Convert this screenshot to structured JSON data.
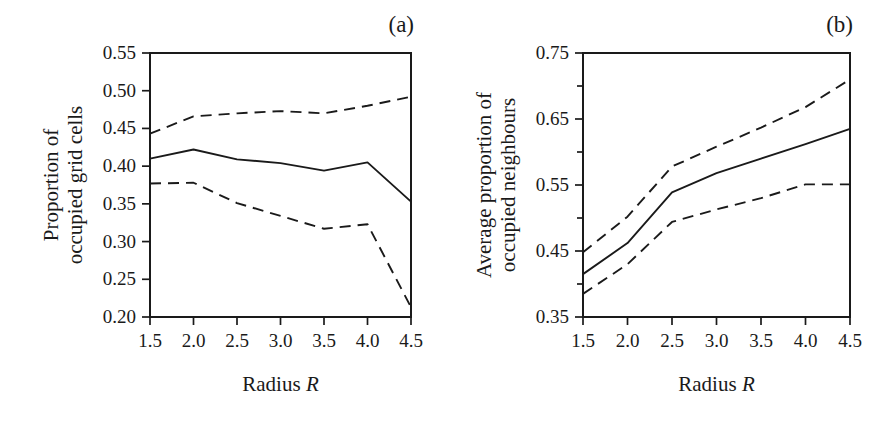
{
  "figure": {
    "panel_a_tag": "(a)",
    "panel_b_tag": "(b)",
    "xlabel_text": "Radius",
    "xlabel_symbol": "R"
  },
  "chart_data": [
    {
      "type": "line",
      "panel": "(a)",
      "title": "",
      "xlabel": "Radius R",
      "ylabel": "Proportion of occupied grid cells",
      "ylabel_line1": "Proportion of",
      "ylabel_line2": "occupied grid cells",
      "x": [
        1.5,
        2.0,
        2.5,
        3.0,
        3.5,
        4.0,
        4.5
      ],
      "xlim": [
        1.5,
        4.5
      ],
      "ylim": [
        0.2,
        0.55
      ],
      "xticks": [
        1.5,
        2.0,
        2.5,
        3.0,
        3.5,
        4.0,
        4.5
      ],
      "xticklabels": [
        "1.5",
        "2.0",
        "2.5",
        "3.0",
        "3.5",
        "4.0",
        "4.5"
      ],
      "yticks": [
        0.2,
        0.25,
        0.3,
        0.35,
        0.4,
        0.45,
        0.5,
        0.55
      ],
      "yticklabels": [
        "0.20",
        "0.25",
        "0.30",
        "0.35",
        "0.40",
        "0.45",
        "0.50",
        "0.55"
      ],
      "grid": false,
      "legend": "none",
      "series": [
        {
          "name": "upper confidence bound",
          "style": "dashed",
          "values": [
            0.443,
            0.466,
            0.47,
            0.473,
            0.47,
            0.48,
            0.492
          ]
        },
        {
          "name": "mean",
          "style": "solid",
          "values": [
            0.41,
            0.422,
            0.409,
            0.404,
            0.394,
            0.405,
            0.353
          ]
        },
        {
          "name": "lower confidence bound",
          "style": "dashed",
          "values": [
            0.377,
            0.378,
            0.351,
            0.334,
            0.317,
            0.323,
            0.213
          ]
        }
      ]
    },
    {
      "type": "line",
      "panel": "(b)",
      "title": "",
      "xlabel": "Radius R",
      "ylabel": "Average proportion of occupied neighbours",
      "ylabel_line1": "Average proportion of",
      "ylabel_line2": "occupied neighbours",
      "x": [
        1.5,
        2.0,
        2.5,
        3.0,
        3.5,
        4.0,
        4.5
      ],
      "xlim": [
        1.5,
        4.5
      ],
      "ylim": [
        0.35,
        0.75
      ],
      "xticks": [
        1.5,
        2.0,
        2.5,
        3.0,
        3.5,
        4.0,
        4.5
      ],
      "xticklabels": [
        "1.5",
        "2.0",
        "2.5",
        "3.0",
        "3.5",
        "4.0",
        "4.5"
      ],
      "yticks": [
        0.35,
        0.45,
        0.55,
        0.65,
        0.75
      ],
      "yticklabels": [
        "0.35",
        "0.45",
        "0.55",
        "0.65",
        "0.75"
      ],
      "yticks_minor": [
        0.4,
        0.5,
        0.6,
        0.7
      ],
      "grid": false,
      "legend": "none",
      "series": [
        {
          "name": "upper confidence bound",
          "style": "dashed",
          "values": [
            0.448,
            0.502,
            0.578,
            0.608,
            0.637,
            0.668,
            0.71
          ]
        },
        {
          "name": "mean",
          "style": "solid",
          "values": [
            0.415,
            0.462,
            0.539,
            0.568,
            0.59,
            0.612,
            0.635
          ]
        },
        {
          "name": "lower confidence bound",
          "style": "dashed",
          "values": [
            0.385,
            0.43,
            0.494,
            0.513,
            0.53,
            0.551,
            0.551
          ]
        }
      ]
    }
  ]
}
